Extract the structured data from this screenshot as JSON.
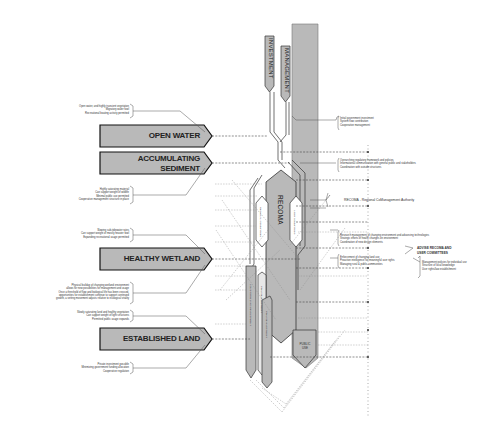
{
  "diagram": {
    "top_columns": {
      "investment": "INVESTMENT",
      "management": "MANAGEMENT"
    },
    "stages": [
      {
        "label": "OPEN WATER",
        "notes_above": [
          "Open water, and highly transient vegetation",
          "Migratory water fowl",
          "Recreational boating activity permitted"
        ]
      },
      {
        "label_line1": "ACCUMULATING",
        "label_line2": "SEDIMENT",
        "notes_below": [
          "Highly saturating material",
          "Can support weight of wildlife",
          "Minimal public use permitted",
          "Cooperative management structure in place"
        ]
      },
      {
        "label": "HEALTHY WETLAND",
        "notes_above": [
          "Slowing sub-tidewater rates",
          "Can support weight of mostly heavier fowl",
          "Expanding recreational usage permitted"
        ],
        "notes_below": [
          "Physical buildup of changing wetland environment",
          "allows for new possibilities for management and usage",
          "Once a threshold of flow and biological life has been crossed,",
          "opportunities for establishment continue to support continued",
          "growth, a vetting movement adjusts relative to ecological vitality"
        ]
      },
      {
        "label": "ESTABLISHED LAND",
        "notes_above": [
          "Slowly saturating land and healthy vegetation",
          "Can support weight of light structures",
          "Permitted public usage expands"
        ],
        "notes_below": [
          "Private investment possible",
          "Minimizing government funding allocation",
          "Cooperative regulation"
        ]
      }
    ],
    "central": {
      "recoma": "RECOMA",
      "left_pill": "REGIONAL COMMITTEES",
      "right_pill": "USER COMMITTEES",
      "lower_left_pill": "LONG-TERM LAND DEVELOPMENT",
      "lower_mid_pill": "PRIVATE INVESTMENT",
      "lower_right_pill": "PRIVATE INVESTMENT",
      "public_use_line1": "PUBLIC",
      "public_use_line2": "USE"
    },
    "right_notes": {
      "investment_notes": [
        "Initial government investment",
        "System flow contribution",
        "Cooperative management"
      ],
      "framework_notes": [
        "Overarching regulatory framework and policies",
        "Informational communication with general public and stakeholders",
        "Coordination with outside structures"
      ],
      "recoma_definition": "RECOMA - Regional CoManagement Authority",
      "research_notes": [
        "Research management of changing environment and advancing technologies",
        "Strategic efforts of health changes on environment",
        "Coordination of new design elements"
      ],
      "advise_line1": "ADVISE RECOMA AND",
      "advise_line2": "USER COMMITTEES",
      "enforcement_notes": [
        "Enforcement of changing land use",
        "Proactive intelligence for meaningful user rights",
        "Managing rural & public communities"
      ],
      "management_policies": [
        "Management policies for individual use",
        "Structure of local knowledge",
        "User rights/law establishment"
      ]
    },
    "colors": {
      "fill_gray": "#b9b9b9",
      "dark_stroke": "#222222",
      "dashed_line": "#555555"
    }
  }
}
